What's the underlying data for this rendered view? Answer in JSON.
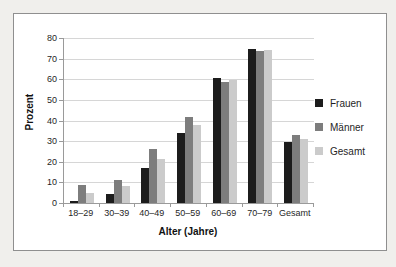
{
  "page": {
    "background": "#f0efec",
    "panel_border": "#8f8f8f"
  },
  "chart_data": {
    "type": "bar",
    "title": "",
    "xlabel": "Alter (Jahre)",
    "ylabel": "Prozent",
    "categories": [
      "18–29",
      "30–39",
      "40–49",
      "50–59",
      "60–69",
      "70–79",
      "Gesamt"
    ],
    "series": [
      {
        "name": "Frauen",
        "color": "#1c1c1c",
        "values": [
          1,
          4.5,
          17,
          34,
          60.5,
          74.5,
          29.5
        ]
      },
      {
        "name": "Männer",
        "color": "#7d7d7d",
        "values": [
          8.5,
          11,
          26,
          41.5,
          58.5,
          73.5,
          33
        ]
      },
      {
        "name": "Gesamt",
        "color": "#cbcbcb",
        "values": [
          5,
          8,
          21.5,
          38,
          59.5,
          74,
          31
        ]
      }
    ],
    "ylim": [
      0,
      80
    ],
    "ytick_step": 10,
    "yticks": [
      0,
      10,
      20,
      30,
      40,
      50,
      60,
      70,
      80
    ],
    "grid": true,
    "gridline_color": "#d6d6d6",
    "axis_color": "#9a9a9a",
    "legend_position": "right"
  }
}
